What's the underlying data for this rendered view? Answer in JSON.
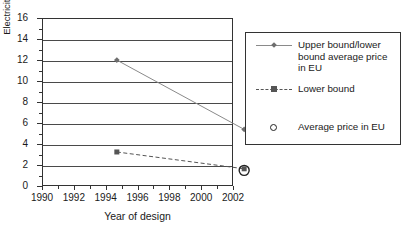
{
  "chart_data": {
    "type": "line",
    "title": "",
    "xlabel": "Year of design",
    "ylabel": "Electricity cost (p/kWh, 2000 prices)",
    "xlim": [
      1990,
      2002
    ],
    "ylim": [
      0,
      16
    ],
    "xticks": [
      1990,
      1992,
      1994,
      1996,
      1998,
      2000,
      2002
    ],
    "yticks": [
      0,
      2,
      4,
      6,
      8,
      10,
      12,
      14,
      16
    ],
    "xtick_labels": [
      "1990",
      "1992",
      "1994",
      "1996",
      "1998",
      "2000",
      "2002"
    ],
    "ytick_labels": [
      "0",
      "2",
      "4",
      "6",
      "8",
      "10",
      "12",
      "14",
      "16"
    ],
    "grid": "horizontal",
    "legend_position": "right",
    "series": [
      {
        "name": "Upper bound/lower bound average price in EU",
        "style": "solid",
        "marker": "diamond",
        "color": "#8a8a8a",
        "x": [
          1992,
          2000
        ],
        "values": [
          13.8,
          7.2
        ]
      },
      {
        "name": "Lower bound",
        "style": "dashed",
        "marker": "square",
        "color": "#555555",
        "x": [
          1992,
          2000
        ],
        "values": [
          5.05,
          3.45
        ]
      },
      {
        "name": "Average price in EU",
        "style": "none",
        "marker": "open-circle",
        "color": "#222222",
        "x": [
          2000
        ],
        "values": [
          3.3
        ]
      }
    ]
  },
  "legend": {
    "entries": [
      {
        "label": "Upper bound/lower bound average price in EU",
        "marker": "diamond-line"
      },
      {
        "label": "Lower bound",
        "marker": "square-dashed-line"
      },
      {
        "label": "Average price in EU",
        "marker": "open-circle"
      }
    ]
  }
}
